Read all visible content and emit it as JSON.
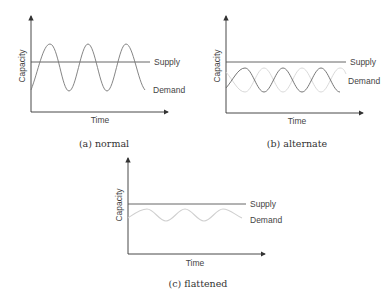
{
  "figure": {
    "panels": [
      {
        "id": "a",
        "caption": "(a) normal",
        "ylabel": "Capacity",
        "xlabel": "Time",
        "supply_label": "Supply",
        "demand_label": "Demand"
      },
      {
        "id": "b",
        "caption": "(b) alternate",
        "ylabel": "Capacity",
        "xlabel": "Time",
        "supply_label": "Supply",
        "demand_label": "Demand"
      },
      {
        "id": "c",
        "caption": "(c) flattened",
        "ylabel": "Capacity",
        "xlabel": "Time",
        "supply_label": "Supply",
        "demand_label": "Demand"
      }
    ]
  },
  "colors": {
    "axis": "#333333",
    "supply": "#555555",
    "demand_dark": "#666666",
    "demand_light": "#cfcfcf"
  }
}
